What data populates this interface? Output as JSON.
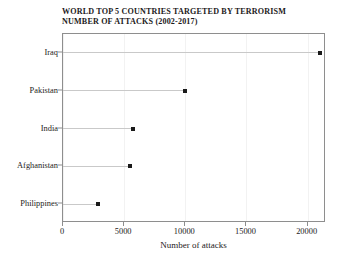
{
  "chart_data": {
    "type": "scatter",
    "title": "WORLD TOP 5 COUNTRIES TARGETED BY TERRORISM\nNUMBER OF ATTACKS (2002-2017)",
    "title_lines": [
      "WORLD TOP 5 COUNTRIES TARGETED BY TERRORISM",
      "NUMBER OF ATTACKS (2002-2017)"
    ],
    "subtitle": "",
    "xlabel": "Number of attacks",
    "ylabel": "",
    "categories": [
      "Iraq",
      "Pakistan",
      "India",
      "Afghanistan",
      "Philippines"
    ],
    "values": [
      21000,
      10000,
      5700,
      5500,
      2900
    ],
    "series": [
      {
        "name": "Number of attacks",
        "values": [
          21000,
          10000,
          5700,
          5500,
          2900
        ]
      }
    ],
    "xlim": [
      0,
      21500
    ],
    "ylim": [
      0,
      5
    ],
    "xticks": [
      0,
      5000,
      10000,
      15000,
      20000
    ],
    "xtick_labels": [
      "0",
      "5000",
      "10000",
      "15000",
      "20000"
    ],
    "ytick_labels": [
      "Iraq",
      "Pakistan",
      "India",
      "Afghanistan",
      "Philippines"
    ],
    "grid": true,
    "grid_axis": "x",
    "legend": false,
    "legend_position": "none",
    "orientation": "horizontal",
    "marker": "square",
    "annotations": []
  },
  "style": {
    "marker_color": "#1a1a1a",
    "stem_color": "#c9c9c9",
    "frame_color": "#8e8e8e",
    "grid_color": "#f2f2f2",
    "background": "#ffffff",
    "text_color": "#1d1a1b"
  }
}
